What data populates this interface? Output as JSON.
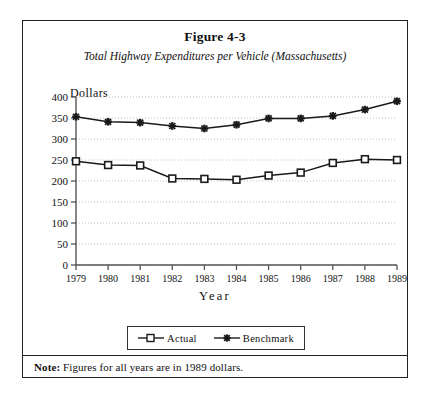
{
  "figure": {
    "title": "Figure 4-3",
    "subtitle": "Total Highway Expenditures per Vehicle (Massachusetts)",
    "note_label": "Note:",
    "note_text": " Figures for all years are in 1989 dollars."
  },
  "axes": {
    "y_caption": "Dollars",
    "x_caption": "Year"
  },
  "legend": {
    "items": [
      {
        "label": "Actual",
        "marker": "open-square",
        "color": "#1a1a1a"
      },
      {
        "label": "Benchmark",
        "marker": "filled-star",
        "color": "#1a1a1a"
      }
    ]
  },
  "colors": {
    "frame": "#222222",
    "gridline": "#b9b9b9",
    "axis": "#555555",
    "series_actual": "#1a1a1a",
    "series_benchmark": "#1a1a1a",
    "background": "#ffffff"
  },
  "chart_data": {
    "type": "line",
    "title": "Figure 4-3",
    "subtitle": "Total Highway Expenditures per Vehicle (Massachusetts)",
    "xlabel": "Year",
    "ylabel": "Dollars",
    "categories": [
      "1979",
      "1980",
      "1981",
      "1982",
      "1983",
      "1984",
      "1985",
      "1986",
      "1987",
      "1988",
      "1989"
    ],
    "x": [
      1979,
      1980,
      1981,
      1982,
      1983,
      1984,
      1985,
      1986,
      1987,
      1988,
      1989
    ],
    "ylim": [
      0,
      400
    ],
    "yticks": [
      0,
      50,
      100,
      150,
      200,
      250,
      300,
      350,
      400
    ],
    "grid": "horizontal-dotted",
    "legend_position": "bottom-center",
    "series": [
      {
        "name": "Actual",
        "marker": "open-square",
        "values": [
          247,
          238,
          237,
          206,
          205,
          203,
          213,
          220,
          243,
          252,
          250
        ]
      },
      {
        "name": "Benchmark",
        "marker": "filled-star",
        "values": [
          353,
          341,
          339,
          331,
          325,
          334,
          349,
          349,
          355,
          370,
          390
        ]
      }
    ],
    "annotations": [
      "Note: Figures for all years are in 1989 dollars."
    ]
  }
}
